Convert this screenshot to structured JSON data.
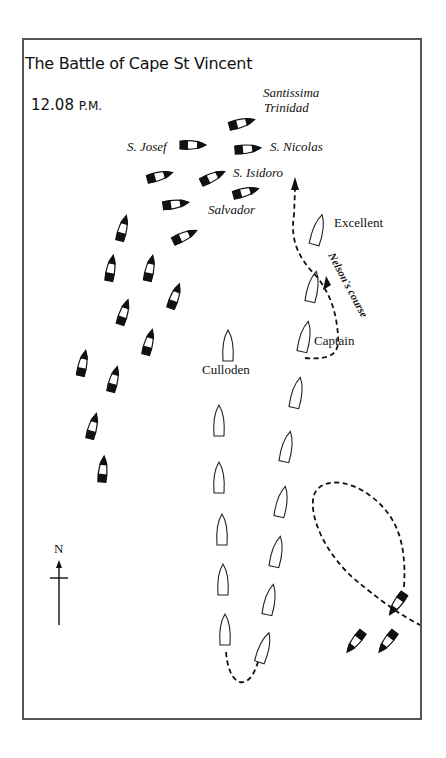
{
  "map": {
    "title": "The Battle of Cape St Vincent",
    "time": "12.08",
    "time_suffix": "P.M.",
    "compass": {
      "label": "N"
    },
    "spanish_ships_labels": {
      "santissima_line1": "Santissima",
      "santissima_line2": "Trinidad",
      "s_josef": "S. Josef",
      "s_nicolas": "S. Nicolas",
      "s_isidoro": "S. Isidoro",
      "salvador": "Salvador"
    },
    "british_ships_labels": {
      "excellent": "Excellent",
      "captain": "Captain",
      "culloden": "Culloden"
    },
    "route_label": "Nelson's course",
    "colors": {
      "ink": "#111111",
      "frame": "#555555",
      "background": "#ffffff"
    }
  }
}
